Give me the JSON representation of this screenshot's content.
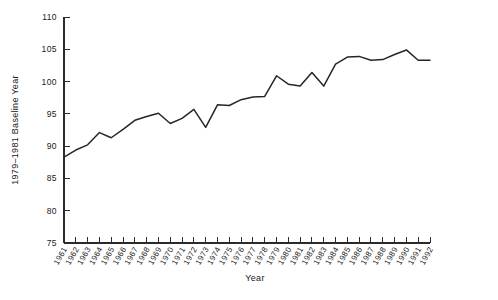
{
  "chart_data": {
    "type": "line",
    "title": "",
    "xlabel": "Year",
    "ylabel": "1979–1981 Baseline Year",
    "xlim": [
      1961,
      1992
    ],
    "ylim": [
      75,
      110
    ],
    "ytick_labels": [
      "110",
      "105",
      "100",
      "95",
      "90",
      "85",
      "80",
      "75"
    ],
    "yticks": [
      110,
      105,
      100,
      95,
      90,
      85,
      80,
      75
    ],
    "grid": false,
    "legend": "none",
    "categories": [
      "1961",
      "1962",
      "1963",
      "1964",
      "1965",
      "1966",
      "1967",
      "1968",
      "1969",
      "1970",
      "1971",
      "1972",
      "1973",
      "1974",
      "1975",
      "1976",
      "1977",
      "1978",
      "1979",
      "1980",
      "1981",
      "1982",
      "1983",
      "1984",
      "1985",
      "1986",
      "1987",
      "1988",
      "1989",
      "1990",
      "1991",
      "1992"
    ],
    "x": [
      1961,
      1962,
      1963,
      1964,
      1965,
      1966,
      1967,
      1968,
      1969,
      1970,
      1971,
      1972,
      1973,
      1974,
      1975,
      1976,
      1977,
      1978,
      1979,
      1980,
      1981,
      1982,
      1983,
      1984,
      1985,
      1986,
      1987,
      1988,
      1989,
      1990,
      1991,
      1992
    ],
    "values": [
      88.3,
      89.4,
      90.2,
      92.1,
      91.3,
      92.6,
      94.0,
      94.6,
      95.1,
      93.5,
      94.3,
      95.7,
      92.9,
      96.4,
      96.3,
      97.2,
      97.6,
      97.7,
      100.9,
      99.6,
      99.3,
      101.4,
      99.3,
      102.7,
      103.8,
      103.9,
      103.3,
      103.4,
      104.2,
      104.9,
      103.3,
      103.3
    ],
    "series": [
      {
        "name": "index",
        "color": "#262626",
        "values": [
          88.3,
          89.4,
          90.2,
          92.1,
          91.3,
          92.6,
          94.0,
          94.6,
          95.1,
          93.5,
          94.3,
          95.7,
          92.9,
          96.4,
          96.3,
          97.2,
          97.6,
          97.7,
          100.9,
          99.6,
          99.3,
          101.4,
          99.3,
          102.7,
          103.8,
          103.9,
          103.3,
          103.4,
          104.2,
          104.9,
          103.3,
          103.3
        ]
      }
    ]
  },
  "axes": {
    "y_title": "1979–1981 Baseline Year",
    "x_title": "Year"
  },
  "colors": {
    "line": "#262626",
    "axis": "#2b2b2b",
    "background": "#ffffff",
    "text": "#1a1a1a"
  }
}
